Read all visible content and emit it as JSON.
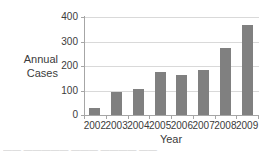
{
  "chart_data": {
    "type": "bar",
    "title": "",
    "xlabel": "Year",
    "ylabel": "Annual Cases",
    "ylabel_line1": "Annual",
    "ylabel_line2": "Cases",
    "categories": [
      "2002",
      "2003",
      "2004",
      "2005",
      "2006",
      "2007",
      "2008",
      "2009"
    ],
    "values": [
      27,
      92,
      105,
      175,
      165,
      185,
      275,
      368
    ],
    "ylim": [
      0,
      400
    ],
    "yticks": [
      "0",
      "100",
      "200",
      "300",
      "400"
    ],
    "ytick_values": [
      0,
      100,
      200,
      300,
      400
    ],
    "grid": "horizontal",
    "legend": "none",
    "bar_color": "#808080",
    "gridline_color": "#d9d9d9",
    "axis_color": "#a6a6a6",
    "text_color": "#3b3b3b",
    "background_color": "#ffffff"
  },
  "caption": {
    "partial_text": "—— ————— ——— ———— ——"
  }
}
